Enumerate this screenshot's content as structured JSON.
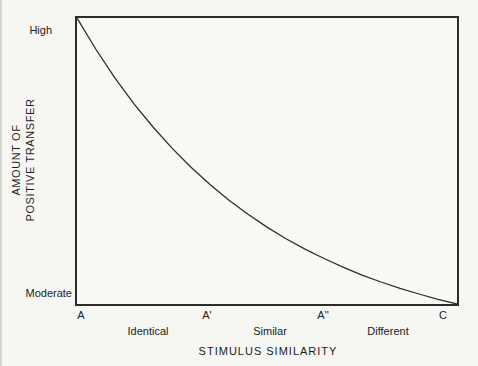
{
  "figure": {
    "background": "#f6f6f3",
    "line_color": "#2e2e2e",
    "y_axis": {
      "title_line1": "AMOUNT OF",
      "title_line2": "POSITIVE TRANSFER",
      "tick_high": "High",
      "tick_moderate": "Moderate"
    },
    "x_axis": {
      "title": "STIMULUS SIMILARITY",
      "tick_labels": [
        "A",
        "A'",
        "A''",
        "C"
      ],
      "region_labels": [
        "Identical",
        "Similar",
        "Different"
      ]
    }
  },
  "chart_data": {
    "type": "line",
    "title": "",
    "xlabel": "STIMULUS SIMILARITY",
    "ylabel": "AMOUNT OF POSITIVE TRANSFER",
    "x_tick_labels": [
      "A",
      "A'",
      "A''",
      "C"
    ],
    "x_tick_fractions": [
      0.013,
      0.343,
      0.647,
      0.96
    ],
    "x_region_labels": [
      "Identical",
      "Similar",
      "Different"
    ],
    "x_region_fractions": [
      0.188,
      0.508,
      0.817
    ],
    "y_tick_labels": [
      "High",
      "Moderate"
    ],
    "y_tick_fractions_from_top": [
      0.0,
      1.0
    ],
    "grid": false,
    "legend": "none",
    "plot_border": "full-box",
    "curve": {
      "name": "positive-transfer-vs-stimulus-similarity",
      "shape": "exponential-decay",
      "description": "Transfer is High for identical stimuli (A) and decays smoothly to Moderate for different stimuli (C).",
      "points": [
        [
          0.0,
          0.0
        ],
        [
          0.05,
          0.11
        ],
        [
          0.1,
          0.21
        ],
        [
          0.15,
          0.3
        ],
        [
          0.2,
          0.381
        ],
        [
          0.25,
          0.455
        ],
        [
          0.3,
          0.522
        ],
        [
          0.35,
          0.582
        ],
        [
          0.4,
          0.637
        ],
        [
          0.45,
          0.686
        ],
        [
          0.5,
          0.731
        ],
        [
          0.55,
          0.772
        ],
        [
          0.6,
          0.808
        ],
        [
          0.65,
          0.841
        ],
        [
          0.7,
          0.871
        ],
        [
          0.75,
          0.899
        ],
        [
          0.8,
          0.923
        ],
        [
          0.85,
          0.945
        ],
        [
          0.9,
          0.965
        ],
        [
          0.95,
          0.984
        ],
        [
          1.0,
          1.0
        ]
      ]
    }
  }
}
